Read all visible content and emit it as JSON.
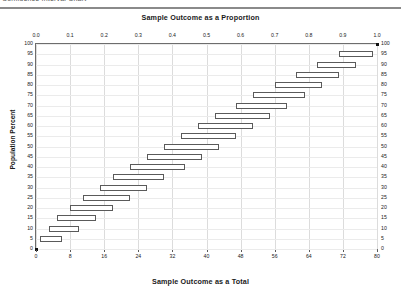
{
  "window": {
    "clipped_header_text": "Confidence Interval Chart"
  },
  "chart": {
    "title_top": "Sample Outcome as a Proportion",
    "title_bottom": "Sample Outcome as a Total",
    "ylabel": "Population Percent"
  },
  "chart_data": {
    "type": "bar",
    "title": "Sample Outcome as a Proportion",
    "xlabel": "Sample Outcome as a Total",
    "ylabel": "Population Percent",
    "grid": true,
    "legend": null,
    "orientation": "horizontal",
    "note": "Horizontal floating bars show the sample-outcome interval (low to high) for each population percent level.",
    "x_axis_bottom": {
      "label": "Sample Outcome as a Total",
      "range": [
        0,
        80
      ],
      "ticks": [
        0,
        8,
        16,
        24,
        32,
        40,
        48,
        56,
        64,
        72,
        80
      ],
      "ticklabels": [
        "0",
        "8",
        "16",
        "24",
        "32",
        "40",
        "48",
        "56",
        "64",
        "72",
        "80"
      ]
    },
    "x_axis_top": {
      "label": "Sample Outcome as a Proportion",
      "range": [
        0.0,
        1.0
      ],
      "ticks": [
        0.0,
        0.1,
        0.2,
        0.3,
        0.4,
        0.5,
        0.6,
        0.7,
        0.8,
        0.9,
        1.0
      ],
      "ticklabels": [
        "0.0",
        "0.1",
        "0.2",
        "0.3",
        "0.4",
        "0.5",
        "0.6",
        "0.7",
        "0.8",
        "0.9",
        "1.0"
      ]
    },
    "y_axis": {
      "label": "Population Percent",
      "range": [
        0,
        100
      ],
      "ticks": [
        0,
        5,
        10,
        15,
        20,
        25,
        30,
        35,
        40,
        45,
        50,
        55,
        60,
        65,
        70,
        75,
        80,
        85,
        90,
        95,
        100
      ],
      "ticklabels": [
        "0",
        "5",
        "10",
        "15",
        "20",
        "25",
        "30",
        "35",
        "40",
        "45",
        "50",
        "55",
        "60",
        "65",
        "70",
        "75",
        "80",
        "85",
        "90",
        "95",
        "100"
      ],
      "mirrored_right_axis": true
    },
    "categories": [
      100,
      95,
      90,
      85,
      80,
      75,
      70,
      65,
      60,
      55,
      50,
      45,
      40,
      35,
      30,
      25,
      20,
      15,
      10,
      5,
      0
    ],
    "intervals": [
      {
        "percent": 100,
        "low": 80,
        "high": 80,
        "point": true
      },
      {
        "percent": 95,
        "low": 71,
        "high": 79
      },
      {
        "percent": 90,
        "low": 66,
        "high": 75
      },
      {
        "percent": 85,
        "low": 61,
        "high": 71
      },
      {
        "percent": 80,
        "low": 56,
        "high": 67
      },
      {
        "percent": 75,
        "low": 51,
        "high": 63
      },
      {
        "percent": 70,
        "low": 47,
        "high": 59
      },
      {
        "percent": 65,
        "low": 42,
        "high": 55
      },
      {
        "percent": 60,
        "low": 38,
        "high": 51
      },
      {
        "percent": 55,
        "low": 34,
        "high": 47
      },
      {
        "percent": 50,
        "low": 30,
        "high": 43
      },
      {
        "percent": 45,
        "low": 26,
        "high": 39
      },
      {
        "percent": 40,
        "low": 22,
        "high": 35
      },
      {
        "percent": 35,
        "low": 18,
        "high": 30
      },
      {
        "percent": 30,
        "low": 15,
        "high": 26
      },
      {
        "percent": 25,
        "low": 11,
        "high": 22
      },
      {
        "percent": 20,
        "low": 8,
        "high": 18
      },
      {
        "percent": 15,
        "low": 5,
        "high": 14
      },
      {
        "percent": 10,
        "low": 3,
        "high": 10
      },
      {
        "percent": 5,
        "low": 1,
        "high": 6
      },
      {
        "percent": 0,
        "low": 0,
        "high": 0,
        "point": true
      }
    ]
  }
}
